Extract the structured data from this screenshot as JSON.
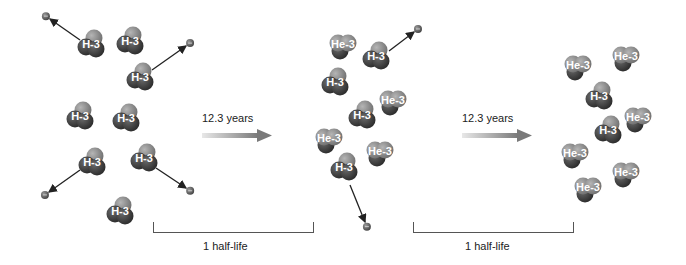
{
  "diagram": {
    "arrows": [
      {
        "label": "12.3 years",
        "x": 202,
        "y": 113
      },
      {
        "label": "12.3 years",
        "x": 462,
        "y": 113
      }
    ],
    "brackets": [
      {
        "label": "1 half-life",
        "x1": 153,
        "x2": 312,
        "y": 222
      },
      {
        "label": "1 half-life",
        "x1": 413,
        "x2": 572,
        "y": 222
      }
    ],
    "colors": {
      "dark_sphere": "#3a3a3a",
      "light_sphere": "#8a8a8a",
      "electron": "#6a6a6a",
      "arrow": "#222222"
    },
    "nuclei": [
      {
        "label": "H-3",
        "x": 91,
        "y": 45
      },
      {
        "label": "H-3",
        "x": 130,
        "y": 42
      },
      {
        "label": "H-3",
        "x": 140,
        "y": 78
      },
      {
        "label": "H-3",
        "x": 80,
        "y": 117
      },
      {
        "label": "H-3",
        "x": 126,
        "y": 119
      },
      {
        "label": "H-3",
        "x": 92,
        "y": 163
      },
      {
        "label": "H-3",
        "x": 144,
        "y": 159
      },
      {
        "label": "H-3",
        "x": 120,
        "y": 212
      },
      {
        "label": "He-3",
        "x": 343,
        "y": 45
      },
      {
        "label": "H-3",
        "x": 376,
        "y": 57
      },
      {
        "label": "H-3",
        "x": 335,
        "y": 83
      },
      {
        "label": "He-3",
        "x": 393,
        "y": 101
      },
      {
        "label": "H-3",
        "x": 362,
        "y": 116
      },
      {
        "label": "He-3",
        "x": 329,
        "y": 139
      },
      {
        "label": "He-3",
        "x": 380,
        "y": 152
      },
      {
        "label": "H-3",
        "x": 344,
        "y": 168
      },
      {
        "label": "He-3",
        "x": 578,
        "y": 66
      },
      {
        "label": "He-3",
        "x": 626,
        "y": 57
      },
      {
        "label": "H-3",
        "x": 599,
        "y": 97
      },
      {
        "label": "He-3",
        "x": 638,
        "y": 118
      },
      {
        "label": "H-3",
        "x": 608,
        "y": 131
      },
      {
        "label": "He-3",
        "x": 575,
        "y": 154
      },
      {
        "label": "He-3",
        "x": 626,
        "y": 173
      },
      {
        "label": "He-3",
        "x": 588,
        "y": 188
      }
    ],
    "emissions": [
      {
        "from": [
          80,
          40
        ],
        "to": [
          50,
          19
        ]
      },
      {
        "from": [
          152,
          70
        ],
        "to": [
          186,
          46
        ]
      },
      {
        "from": [
          80,
          170
        ],
        "to": [
          49,
          192
        ]
      },
      {
        "from": [
          156,
          168
        ],
        "to": [
          186,
          188
        ]
      },
      {
        "from": [
          389,
          51
        ],
        "to": [
          414,
          32
        ]
      },
      {
        "from": [
          350,
          185
        ],
        "to": [
          365,
          222
        ]
      }
    ]
  }
}
